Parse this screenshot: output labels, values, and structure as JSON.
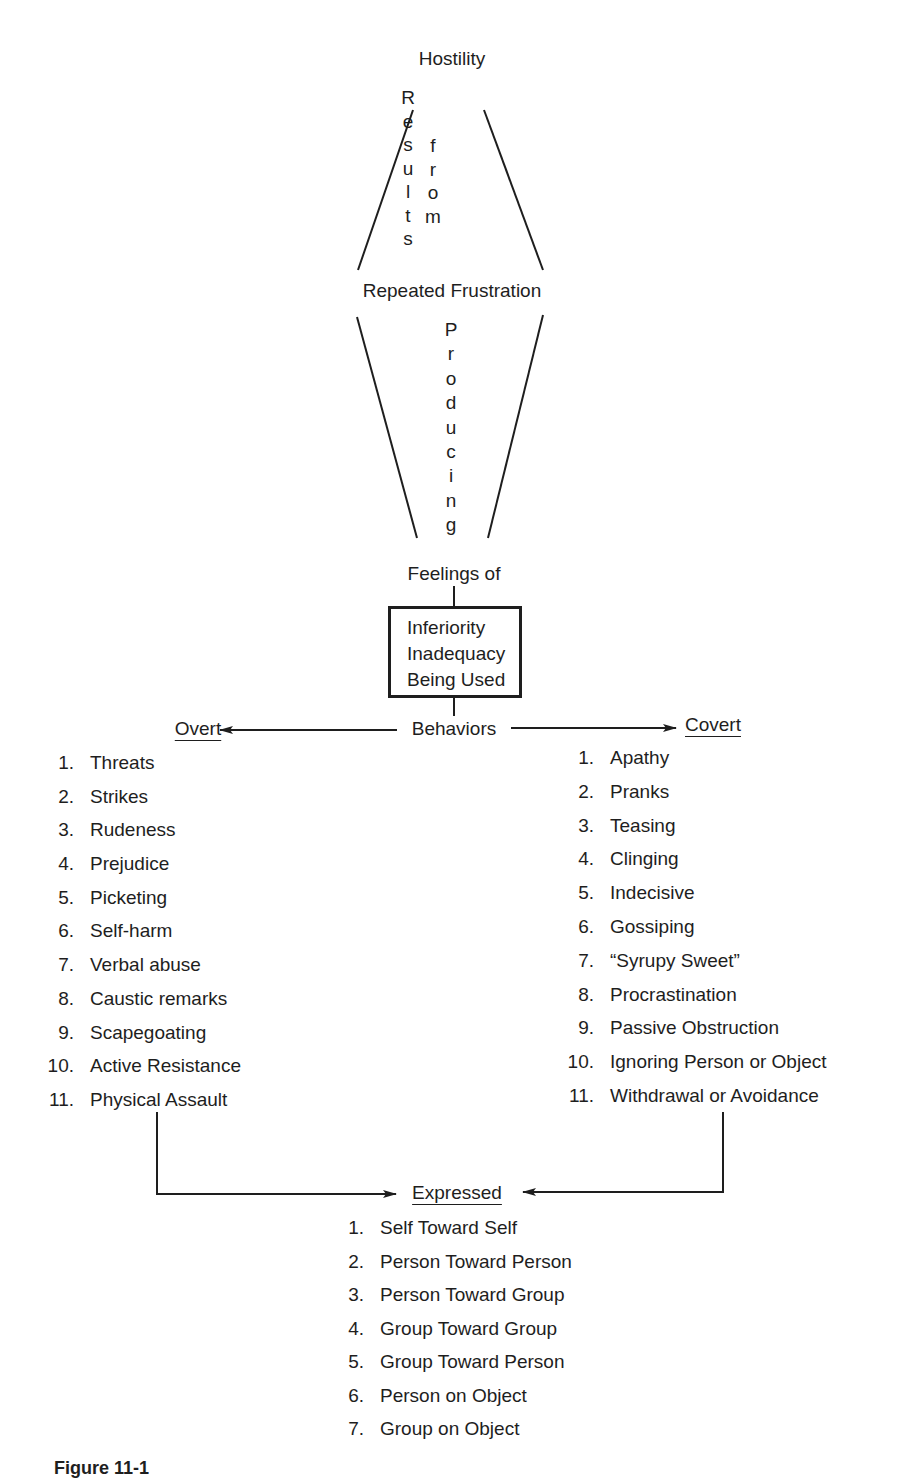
{
  "diagram": {
    "top_node": "Hostility",
    "link_1": {
      "left_column": "Results",
      "right_column": "from"
    },
    "middle_node": "Repeated Frustration",
    "link_2": "Producing",
    "feelings_label": "Feelings of",
    "feelings_box": [
      "Inferiority",
      "Inadequacy",
      "Being Used"
    ],
    "behaviors_label": "Behaviors",
    "overt": {
      "heading": "Overt",
      "items": [
        {
          "num": "1.",
          "label": "Threats"
        },
        {
          "num": "2.",
          "label": "Strikes"
        },
        {
          "num": "3.",
          "label": "Rudeness"
        },
        {
          "num": "4.",
          "label": "Prejudice"
        },
        {
          "num": "5.",
          "label": "Picketing"
        },
        {
          "num": "6.",
          "label": "Self-harm"
        },
        {
          "num": "7.",
          "label": "Verbal abuse"
        },
        {
          "num": "8.",
          "label": "Caustic remarks"
        },
        {
          "num": "9.",
          "label": "Scapegoating"
        },
        {
          "num": "10.",
          "label": "Active Resistance"
        },
        {
          "num": "11.",
          "label": "Physical Assault"
        }
      ]
    },
    "covert": {
      "heading": "Covert",
      "items": [
        {
          "num": "1.",
          "label": "Apathy"
        },
        {
          "num": "2.",
          "label": "Pranks"
        },
        {
          "num": "3.",
          "label": "Teasing"
        },
        {
          "num": "4.",
          "label": "Clinging"
        },
        {
          "num": "5.",
          "label": "Indecisive"
        },
        {
          "num": "6.",
          "label": "Gossiping"
        },
        {
          "num": "7.",
          "label": "“Syrupy Sweet”"
        },
        {
          "num": "8.",
          "label": "Procrastination"
        },
        {
          "num": "9.",
          "label": "Passive Obstruction"
        },
        {
          "num": "10.",
          "label": "Ignoring Person or Object"
        },
        {
          "num": "11.",
          "label": "Withdrawal or Avoidance"
        }
      ]
    },
    "expressed": {
      "heading": "Expressed",
      "items": [
        {
          "num": "1.",
          "label": "Self Toward Self"
        },
        {
          "num": "2.",
          "label": "Person Toward Person"
        },
        {
          "num": "3.",
          "label": "Person Toward Group"
        },
        {
          "num": "4.",
          "label": "Group Toward Group"
        },
        {
          "num": "5.",
          "label": "Group Toward Person"
        },
        {
          "num": "6.",
          "label": "Person on Object"
        },
        {
          "num": "7.",
          "label": "Group on Object"
        }
      ]
    },
    "caption": "Figure 11-1"
  }
}
